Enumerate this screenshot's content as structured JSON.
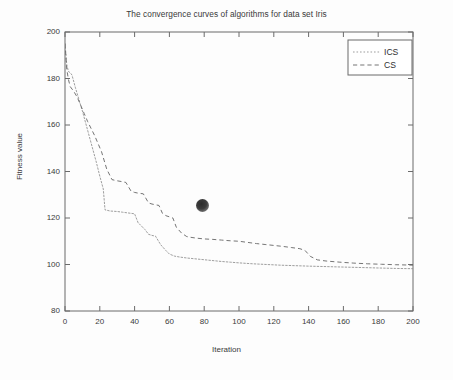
{
  "figure": {
    "background_color": "#fdfdfd",
    "axis_color": "#6b6b6b",
    "text_color": "#3a3a3a"
  },
  "chart_data": {
    "type": "line",
    "title": "The convergence curves of algorithms for data set Iris",
    "xlabel": "Iteration",
    "ylabel": "Fitness value",
    "xlim": [
      0,
      200
    ],
    "ylim": [
      80,
      200
    ],
    "xticks": [
      0,
      20,
      40,
      60,
      80,
      100,
      120,
      140,
      160,
      180,
      200
    ],
    "yticks": [
      80,
      100,
      120,
      140,
      160,
      180,
      200
    ],
    "grid": false,
    "legend_position": "upper right",
    "series": [
      {
        "name": "ICS",
        "style": "dotted",
        "color": "#8c8c8c",
        "x": [
          0,
          1,
          2,
          3,
          4,
          6,
          8,
          10,
          12,
          14,
          16,
          18,
          20,
          22,
          23,
          26,
          30,
          33,
          36,
          38,
          40,
          42,
          44,
          46,
          48,
          50,
          52,
          55,
          58,
          60,
          63,
          66,
          70,
          74,
          78,
          82,
          86,
          90,
          95,
          100,
          108,
          116,
          124,
          132,
          140,
          150,
          160,
          170,
          180,
          190,
          200
        ],
        "y": [
          195.0,
          186.0,
          183.0,
          182.5,
          181.5,
          176.0,
          171.0,
          166.0,
          160.5,
          155.0,
          149.5,
          144.0,
          138.0,
          132.5,
          123.5,
          123.0,
          122.8,
          122.5,
          122.2,
          122.0,
          121.8,
          118.0,
          116.5,
          115.0,
          113.0,
          112.5,
          112.2,
          108.5,
          106.0,
          104.5,
          103.6,
          103.2,
          102.8,
          102.5,
          102.2,
          101.9,
          101.6,
          101.3,
          101.0,
          100.7,
          100.3,
          100.0,
          99.7,
          99.5,
          99.3,
          99.1,
          98.9,
          98.7,
          98.5,
          98.3,
          98.2
        ]
      },
      {
        "name": "CS",
        "style": "dashed",
        "color": "#6e6e6e",
        "x": [
          0,
          1,
          2,
          3,
          5,
          7,
          9,
          11,
          13,
          15,
          17,
          19,
          21,
          24,
          27,
          30,
          33,
          35,
          38,
          40,
          42,
          45,
          48,
          50,
          52,
          54,
          56,
          58,
          60,
          62,
          64,
          67,
          70,
          73,
          76,
          80,
          85,
          90,
          95,
          100,
          105,
          110,
          115,
          120,
          125,
          130,
          135,
          138,
          141,
          145,
          150,
          158,
          166,
          174,
          182,
          190,
          196,
          200
        ],
        "y": [
          195.0,
          184.0,
          179.5,
          176.5,
          174.5,
          172.0,
          168.5,
          165.0,
          161.5,
          158.5,
          155.5,
          152.0,
          148.5,
          141.0,
          136.5,
          136.0,
          135.6,
          135.3,
          131.5,
          131.0,
          130.7,
          130.4,
          126.5,
          126.0,
          125.7,
          125.4,
          122.0,
          121.0,
          120.5,
          120.0,
          116.0,
          113.5,
          112.0,
          111.6,
          111.3,
          111.0,
          110.8,
          110.5,
          110.2,
          110.0,
          109.5,
          109.0,
          108.6,
          108.2,
          107.8,
          107.3,
          106.8,
          106.0,
          103.5,
          102.0,
          101.5,
          101.0,
          100.6,
          100.3,
          100.1,
          99.9,
          99.8,
          99.7
        ]
      }
    ],
    "annotations": [
      {
        "name": "scan-artifact-blob",
        "x": 79.3,
        "y": 125.5,
        "radius_px": 6.5,
        "color": "#2b2b2b"
      }
    ]
  },
  "legend": {
    "entries": [
      {
        "label": "ICS",
        "style": "dotted"
      },
      {
        "label": "CS",
        "style": "dashed"
      }
    ]
  }
}
